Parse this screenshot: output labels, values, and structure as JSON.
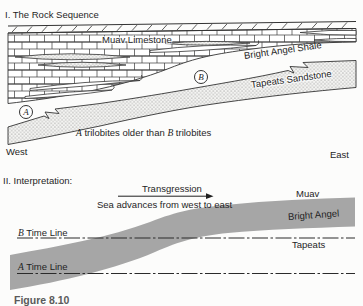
{
  "colors": {
    "ink": "#1f1f1f",
    "line": "#333333",
    "band_gray": "#a6a6a6",
    "caption_gray": "#5a5a5a"
  },
  "section1": {
    "title": "I. The Rock Sequence",
    "units": {
      "muav": "Muav Limestone",
      "bright_angel": "Bright Angel Shale",
      "tapeats": "Tapeats Sandstone"
    },
    "markers": {
      "a": "A",
      "b": "B"
    },
    "note": {
      "a": "A",
      "mid": "trilobites older than",
      "b": "B",
      "end": "trilobites"
    },
    "directions": {
      "west": "West",
      "east": "East"
    }
  },
  "section2": {
    "title": "II. Interpretation:",
    "transgression": "Transgression",
    "sea_advance": "Sea advances from west to east",
    "units": {
      "muav": "Muav",
      "bright_angel": "Bright Angel",
      "tapeats": "Tapeats"
    },
    "time_lines": {
      "b": {
        "letter": "B",
        "label": "Time Line"
      },
      "a": {
        "letter": "A",
        "label": "Time Line"
      }
    }
  },
  "caption": "Figure 8.10"
}
